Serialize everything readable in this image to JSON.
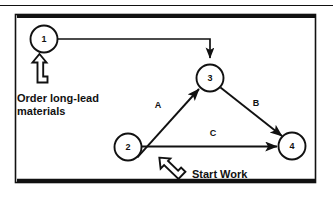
{
  "figure": {
    "kind": "network-activity-diagram",
    "border_color": "#111111",
    "ink_color": "#111111",
    "background": "#ffffff",
    "top_rule": true
  },
  "nodes": [
    {
      "id": "node-1",
      "label": "1",
      "cx": 44,
      "cy": 39,
      "r": 14
    },
    {
      "id": "node-2",
      "label": "2",
      "cx": 128,
      "cy": 147,
      "r": 14
    },
    {
      "id": "node-3",
      "label": "3",
      "cx": 210,
      "cy": 78,
      "r": 14
    },
    {
      "id": "node-4",
      "label": "4",
      "cx": 292,
      "cy": 146,
      "r": 14
    }
  ],
  "edges": [
    {
      "id": "edge-1-3",
      "from": "1",
      "to": "3",
      "label": "",
      "label_x": 0,
      "label_y": 0
    },
    {
      "id": "edge-2-3",
      "from": "2",
      "to": "3",
      "label": "A",
      "label_x": 158,
      "label_y": 108
    },
    {
      "id": "edge-3-4",
      "from": "3",
      "to": "4",
      "label": "B",
      "label_x": 256,
      "label_y": 106
    },
    {
      "id": "edge-2-4",
      "from": "2",
      "to": "4",
      "label": "C",
      "label_x": 213,
      "label_y": 136
    }
  ],
  "annotations": [
    {
      "id": "order-long-lead-annotation",
      "line1": "Order long-lead",
      "line2": "materials",
      "text_x": 17,
      "text_y1": 102,
      "text_y2": 115,
      "callout": "block-arrow-up"
    },
    {
      "id": "start-work-annotation",
      "line1": "Start Work",
      "line2": "",
      "text_x": 192,
      "text_y1": 178,
      "text_y2": 0,
      "callout": "block-arrow-up-left"
    }
  ]
}
